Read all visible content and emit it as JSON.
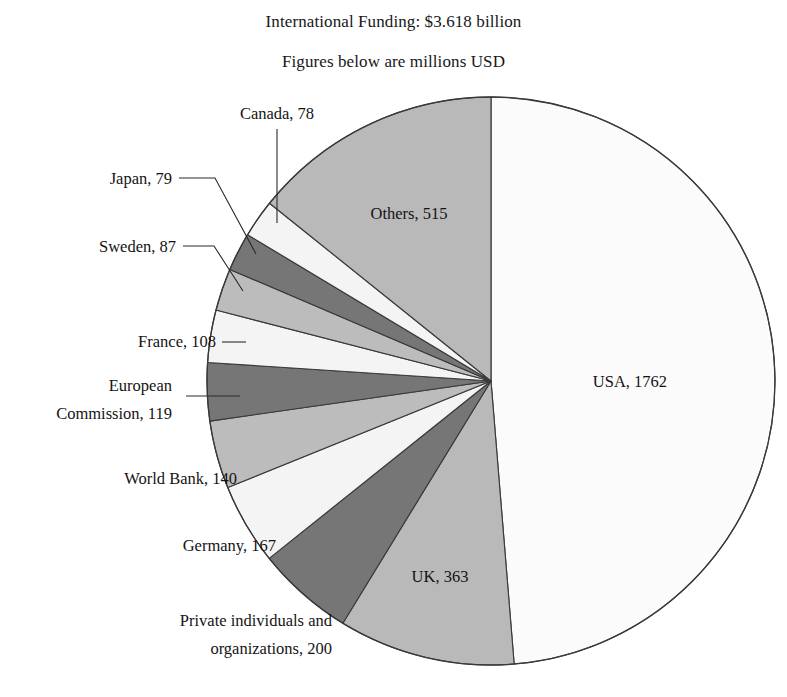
{
  "header": {
    "title": "International Funding: $3.618 billion",
    "subtitle": "Figures below are millions USD"
  },
  "chart_data": {
    "type": "pie",
    "title": "International Funding: $3.618 billion",
    "subtitle": "Figures below are millions USD",
    "units": "millions USD",
    "total": 3618,
    "total_display": "$3.618 billion",
    "legend": "none",
    "grid": false,
    "start_angle_deg": 0,
    "direction": "clockwise",
    "categories": [
      "USA",
      "UK",
      "Private individuals and organizations",
      "Germany",
      "World Bank",
      "European Commission",
      "France",
      "Sweden",
      "Japan",
      "Canada",
      "Others"
    ],
    "values": [
      1762,
      363,
      200,
      167,
      140,
      119,
      108,
      87,
      79,
      78,
      515
    ],
    "slices": [
      {
        "name": "USA",
        "value": 1762,
        "label": "USA, 1762",
        "color": "#fbfbfb",
        "label_placement": "inside"
      },
      {
        "name": "UK",
        "value": 363,
        "label": "UK, 363",
        "color": "#b9b9b9",
        "label_placement": "inside"
      },
      {
        "name": "Private individuals and organizations",
        "value": 200,
        "label": "Private individuals and organizations, 200",
        "label_line1": "Private individuals and",
        "label_line2": "organizations, 200",
        "color": "#767676",
        "label_placement": "outside"
      },
      {
        "name": "Germany",
        "value": 167,
        "label": "Germany, 167",
        "color": "#f4f4f4",
        "label_placement": "outside"
      },
      {
        "name": "World Bank",
        "value": 140,
        "label": "World Bank, 140",
        "color": "#bcbcbc",
        "label_placement": "outside"
      },
      {
        "name": "European Commission",
        "value": 119,
        "label": "European Commission, 119",
        "label_line1": "European",
        "label_line2": "Commission, 119",
        "color": "#767676",
        "label_placement": "outside"
      },
      {
        "name": "France",
        "value": 108,
        "label": "France, 108",
        "color": "#f4f4f4",
        "label_placement": "outside"
      },
      {
        "name": "Sweden",
        "value": 87,
        "label": "Sweden, 87",
        "color": "#bcbcbc",
        "label_placement": "outside"
      },
      {
        "name": "Japan",
        "value": 79,
        "label": "Japan, 79",
        "color": "#767676",
        "label_placement": "outside"
      },
      {
        "name": "Canada",
        "value": 78,
        "label": "Canada, 78",
        "color": "#f4f4f4",
        "label_placement": "outside"
      },
      {
        "name": "Others",
        "value": 515,
        "label": "Others, 515",
        "color": "#b9b9b9",
        "label_placement": "inside"
      }
    ],
    "colors": {
      "light": "#f4f4f4",
      "medium": "#b9b9b9",
      "dark": "#767676",
      "usa": "#fbfbfb",
      "outline": "#3a3a3a",
      "text": "#141414",
      "background": "#ffffff"
    }
  }
}
